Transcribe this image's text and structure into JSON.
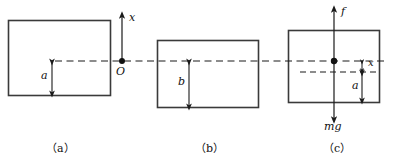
{
  "figure": {
    "type": "physics-diagram",
    "width": 394,
    "height": 164,
    "stroke_color": "#3a3a3a",
    "line_color": "#1a1a1a",
    "background": "#ffffff"
  },
  "panels": [
    {
      "id": "a",
      "caption": "（a）",
      "rect": {
        "x": 8,
        "y": 20,
        "w": 102,
        "h": 75
      },
      "labels": {
        "depth": "a",
        "axis": "x",
        "origin": "O"
      },
      "axis": {
        "name": "x-axis",
        "direction": "up",
        "origin_label": "O",
        "origin_x": 122,
        "origin_y": 61
      },
      "dimension_arrow": {
        "label": "a",
        "from_y": 61,
        "to_y": 95,
        "x": 52
      }
    },
    {
      "id": "b",
      "caption": "（b）",
      "rect": {
        "x": 157,
        "y": 40,
        "w": 101,
        "h": 68
      },
      "labels": {
        "depth": "b"
      },
      "dimension_arrow": {
        "label": "b",
        "from_y": 61,
        "to_y": 108,
        "x": 189
      }
    },
    {
      "id": "c",
      "caption": "（c）",
      "rect": {
        "x": 288,
        "y": 30,
        "w": 91,
        "h": 73
      },
      "labels": {
        "force_up": "f",
        "force_down": "mg",
        "displacement": "x",
        "depth": "a"
      },
      "force_axis": {
        "x": 334,
        "top_y": 8,
        "bottom_y": 122,
        "up_label": "f",
        "down_label": "mg"
      },
      "dimension_arrows": [
        {
          "label": "x",
          "x": 362,
          "from_y": 61,
          "to_y": 72
        },
        {
          "label": "a",
          "x": 362,
          "from_y": 72,
          "to_y": 101
        }
      ]
    }
  ],
  "reference_line": {
    "name": "water-surface-dashed-line",
    "y": 61,
    "x_start": 55,
    "x_end": 386,
    "style": "dashed"
  },
  "secondary_line": {
    "name": "displaced-level-dashed-line",
    "y": 72,
    "x_start": 300,
    "x_end": 379,
    "style": "dashed"
  }
}
